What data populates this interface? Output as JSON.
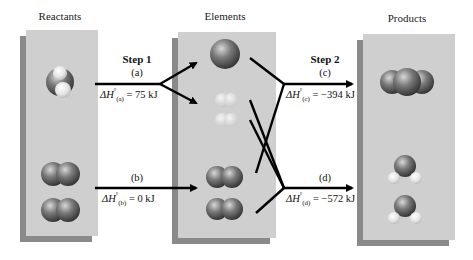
{
  "panels": {
    "reactants": {
      "title": "Reactants"
    },
    "elements": {
      "title": "Elements"
    },
    "products": {
      "title": "Products"
    }
  },
  "step1": {
    "label": "Step 1",
    "reaction_a": {
      "tag": "(a)",
      "dh_prefix": "ΔH",
      "dh_sub": "(a)",
      "dh_value": "= 75 kJ"
    },
    "reaction_b": {
      "tag": "(b)",
      "dh_prefix": "ΔH",
      "dh_sub": "(b)",
      "dh_value": "= 0 kJ"
    }
  },
  "step2": {
    "label": "Step 2",
    "reaction_c": {
      "tag": "(c)",
      "dh_prefix": "ΔH",
      "dh_sub": "(c)",
      "dh_value": "= −394 kJ"
    },
    "reaction_d": {
      "tag": "(d)",
      "dh_prefix": "ΔH",
      "dh_sub": "(d)",
      "dh_value": "= −572 kJ"
    }
  },
  "degree_symbol": "°",
  "colors": {
    "panel": "#cfcfcf",
    "panel_shadow": "#8a8a8a",
    "arrow": "#000000",
    "heavy_atom": "#6a6a6a",
    "light_atom": "#e8e8e8"
  }
}
